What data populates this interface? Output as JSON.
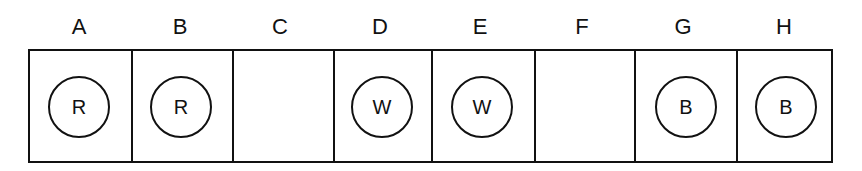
{
  "diagram": {
    "cells": [
      {
        "label": "A",
        "content": "R"
      },
      {
        "label": "B",
        "content": "R"
      },
      {
        "label": "C",
        "content": ""
      },
      {
        "label": "D",
        "content": "W"
      },
      {
        "label": "E",
        "content": "W"
      },
      {
        "label": "F",
        "content": ""
      },
      {
        "label": "G",
        "content": "B"
      },
      {
        "label": "H",
        "content": "B"
      }
    ]
  }
}
